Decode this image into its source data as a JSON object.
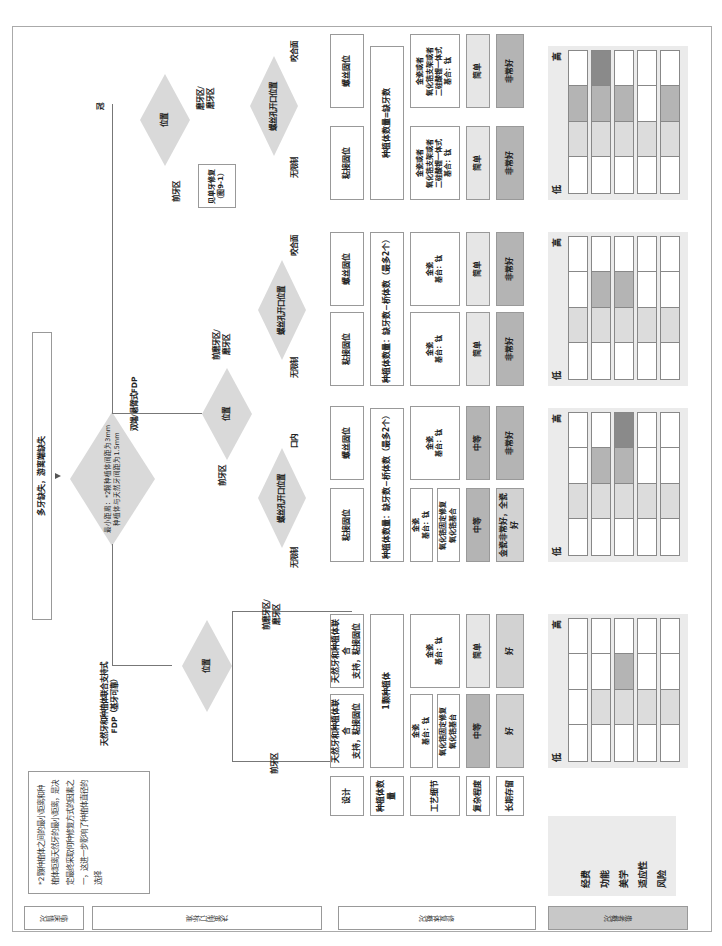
{
  "header": {
    "start_box": "多牙缺失，游离端缺失",
    "main_decision": "最小距离：*2颗种植体间距为3mm\n种植体与天然牙间距为1.5mm",
    "note": "*2颗种植体之间的最小距离和种植体距离天然牙的最小距离，是决定最终采取何种修复方式的因素之一，这进一步影响了种植体直径的选择"
  },
  "branches": {
    "combined": "天然牙和种植体联合支持式\nFDP（基牙可靠）",
    "bridge": "双端/悬臂式FDP",
    "crown": "冠"
  },
  "decisions": {
    "position": "位置",
    "screw_access": "螺丝孔开口位置"
  },
  "edge_labels": {
    "anterior": "前牙区",
    "premolar_molar": "前磨牙区/\n磨牙区",
    "molar": "磨牙区/\n磨牙区",
    "unrestricted": "无限制",
    "occlusal": "咬合面",
    "intraoral": "口内"
  },
  "see_single": "见单牙修复\n（图9-1）",
  "columns": [
    {
      "design": "天然牙和种植体联合\n支持，粘接固位",
      "count": "1颗种植体",
      "tech": [
        "金瓷\n基台：钛",
        "氧化锆固定修复\n氧化锆基台"
      ],
      "complexity": "中等",
      "complexity_level": "mid",
      "longterm": "好",
      "longterm_level": "gray"
    },
    {
      "design": "天然牙和种植体联合\n支持，粘接固位",
      "count": "",
      "tech": [
        "金瓷\n基台：钛"
      ],
      "complexity": "简单",
      "complexity_level": "light",
      "longterm": "好",
      "longterm_level": "gray"
    },
    {
      "design": "粘接固位",
      "count": "种植体数量：缺牙数−桥体数（最多2个）",
      "tech": [
        "金瓷\n基台：钛",
        "氧化锆固定修复\n氧化锆基合"
      ],
      "complexity": "中等",
      "complexity_level": "mid",
      "longterm": "金瓷非常好，全瓷好",
      "longterm_level": "gray"
    },
    {
      "design": "螺丝固位",
      "count": "",
      "tech": [
        "金瓷\n基台：钛"
      ],
      "complexity": "中等",
      "complexity_level": "mid",
      "longterm": "非常好",
      "longterm_level": "mid"
    },
    {
      "design": "粘接固位",
      "count": "种植体数量：缺牙数−桥体数（最多2个）",
      "tech": [
        "金瓷\n基台：钛"
      ],
      "complexity": "简单",
      "complexity_level": "light",
      "longterm": "非常好",
      "longterm_level": "mid"
    },
    {
      "design": "螺丝固位",
      "count": "",
      "tech": [
        "金瓷\n基台：钛"
      ],
      "complexity": "简单",
      "complexity_level": "light",
      "longterm": "非常好",
      "longterm_level": "mid"
    },
    {
      "design": "粘接固位",
      "count": "种植体数量=缺牙数",
      "tech": [
        "金瓷或者\n氧化锆支架或者\n二硅酸锂一体式\n基合：钛"
      ],
      "complexity": "简单",
      "complexity_level": "light",
      "longterm": "非常好",
      "longterm_level": "mid"
    },
    {
      "design": "螺丝固位",
      "count": "",
      "tech": [
        "金瓷或者\n氧化锆支架或者\n二硅酸锂一体式\n基合：钛"
      ],
      "complexity": "简单",
      "complexity_level": "light",
      "longterm": "非常好",
      "longterm_level": "mid"
    }
  ],
  "row_labels": {
    "design": "设计",
    "count": "种植体数量",
    "tech": "工艺细节",
    "complexity": "复杂程度",
    "longterm": "长期存留"
  },
  "patient_factors": [
    "经费",
    "功能",
    "美学",
    "适应性",
    "风险"
  ],
  "scale": {
    "high": "高",
    "low": "低"
  },
  "scale_charts": [
    {
      "levels": [
        1,
        2,
        3,
        2,
        2
      ]
    },
    {
      "levels": [
        2,
        3,
        4,
        2,
        2
      ]
    },
    {
      "levels": [
        2,
        3,
        3,
        2,
        2
      ]
    },
    {
      "levels": [
        3,
        4,
        3,
        2,
        3
      ]
    }
  ],
  "colors": {
    "level1": "#ffffff",
    "level2": "#dcdcdc",
    "level3": "#b4b4b4",
    "level4": "#8a8a8a",
    "diamond": "#d9d9d9"
  },
  "footer": {
    "clinical": "临床情况",
    "criteria": "决策制订标准",
    "prosthesis": "修复体概况",
    "patient": "患者概况"
  }
}
